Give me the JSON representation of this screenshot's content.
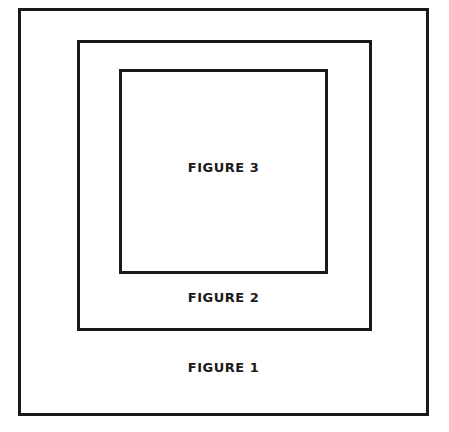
{
  "diagram": {
    "figures": [
      {
        "id": 1,
        "label": "FIGURE 1"
      },
      {
        "id": 2,
        "label": "FIGURE 2"
      },
      {
        "id": 3,
        "label": "FIGURE 3"
      }
    ],
    "stroke_color": "#1a1a1a",
    "background": "#ffffff"
  }
}
